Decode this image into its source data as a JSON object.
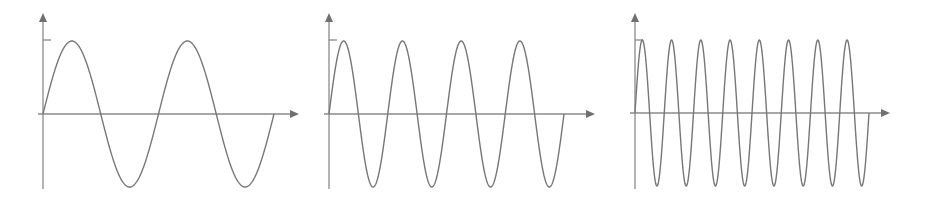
{
  "chart_data": [
    {
      "type": "line",
      "title": "",
      "xlabel": "",
      "ylabel": "",
      "description": "Sine wave, 2 full periods",
      "periods": 2,
      "amplitude": 1,
      "y_ticks": [
        1
      ],
      "grid": false,
      "series": [
        {
          "name": "sine",
          "function": "sin(2*pi*2*t)",
          "t_range": [
            0,
            1
          ]
        }
      ],
      "layout": {
        "origin": [
          43,
          114
        ],
        "x_end": 299,
        "y_top": 13,
        "y_bottom": 189,
        "curve_end": 274,
        "peak_y": 41,
        "trough_y": 187
      }
    },
    {
      "type": "line",
      "title": "",
      "xlabel": "",
      "ylabel": "",
      "description": "Sine wave, 4 full periods",
      "periods": 4,
      "amplitude": 1,
      "y_ticks": [
        1
      ],
      "grid": false,
      "series": [
        {
          "name": "sine",
          "function": "sin(2*pi*4*t)",
          "t_range": [
            0,
            1
          ]
        }
      ],
      "layout": {
        "origin": [
          329,
          114
        ],
        "x_end": 595,
        "y_top": 13,
        "y_bottom": 189,
        "curve_end": 564,
        "peak_y": 41,
        "trough_y": 187
      }
    },
    {
      "type": "line",
      "title": "",
      "xlabel": "",
      "ylabel": "",
      "description": "Sine wave, 8 full periods",
      "periods": 8,
      "amplitude": 1,
      "y_ticks": [
        1
      ],
      "grid": false,
      "series": [
        {
          "name": "sine",
          "function": "sin(2*pi*8*t)",
          "t_range": [
            0,
            1
          ]
        }
      ],
      "layout": {
        "origin": [
          635,
          113
        ],
        "x_end": 890,
        "y_top": 13,
        "y_bottom": 189,
        "curve_end": 869,
        "peak_y": 41,
        "trough_y": 187
      }
    }
  ],
  "colors": {
    "axis": "#8a8a8a",
    "wave": "#777777",
    "arrow": "#707070"
  }
}
